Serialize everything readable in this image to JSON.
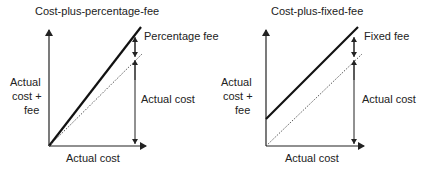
{
  "panels": [
    {
      "title": "Cost-plus-percentage-fee",
      "y_label_lines": [
        "Actual",
        "cost +",
        "fee"
      ],
      "x_label": "Actual cost",
      "fee_label": "Percentage fee",
      "cost_label": "Actual cost",
      "fee_type": "percentage"
    },
    {
      "title": "Cost-plus-fixed-fee",
      "y_label_lines": [
        "Actual",
        "cost +",
        "fee"
      ],
      "x_label": "Actual cost",
      "fee_type": "fixed",
      "fee_label": "Fixed fee",
      "cost_label": "Actual cost"
    }
  ],
  "colors": {
    "ink": "#222222",
    "background": "#ffffff"
  }
}
